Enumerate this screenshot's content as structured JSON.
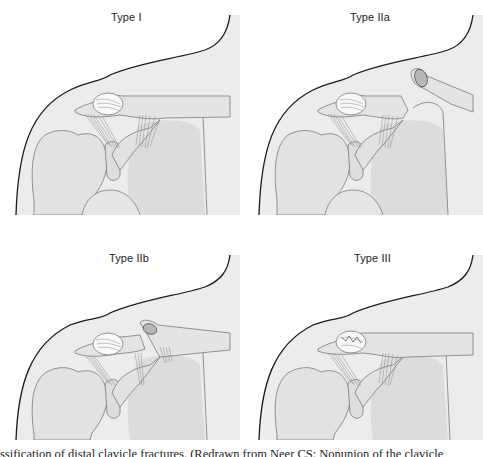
{
  "figure": {
    "panels": [
      {
        "id": "type-i",
        "label": "Type I",
        "has_proximal_fragment": false,
        "fragment_style": "none",
        "fracture_gap": false
      },
      {
        "id": "type-iia",
        "label": "Type IIa",
        "has_proximal_fragment": true,
        "fragment_style": "displaced-up",
        "fracture_gap": true
      },
      {
        "id": "type-iib",
        "label": "Type IIb",
        "has_proximal_fragment": true,
        "fragment_style": "displaced-torn-ligament",
        "fracture_gap": true
      },
      {
        "id": "type-iii",
        "label": "Type III",
        "has_proximal_fragment": false,
        "fragment_style": "articular",
        "fracture_gap": false
      }
    ],
    "caption": "ssification of distal clavicle fractures. (Redrawn from Neer CS: Nonunion of the clavicle",
    "colors": {
      "background": "#ffffff",
      "skin": "#ececec",
      "skin_outline": "#1a1a1a",
      "bone": "#e2e2e2",
      "bone_outline": "#7a7a7a",
      "shadow": "#cfcfcf",
      "ligament": "#8a8a8a",
      "capsule_highlight": "#fafafa",
      "text": "#222222"
    }
  }
}
